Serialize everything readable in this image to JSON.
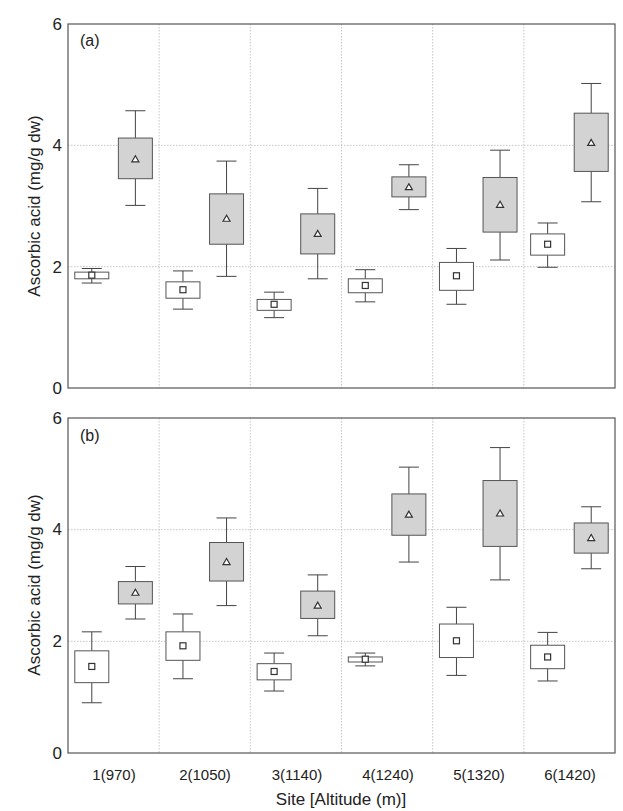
{
  "figure": {
    "ylabel": "Ascorbic acid (mg/g dw)",
    "xlabel": "Site [Altitude (m)]",
    "yticks": [
      "0",
      "2",
      "4",
      "6"
    ],
    "colors": {
      "white_box_fill": "#ffffff",
      "gray_box_fill": "#d3d3d3",
      "box_stroke": "#555555",
      "grid": "#b8b8b8"
    }
  },
  "chart_data": [
    {
      "type": "boxplot",
      "panel_label": "(a)",
      "title": "",
      "xlabel": "",
      "ylabel": "Ascorbic acid (mg/g dw)",
      "ylim": [
        0,
        6
      ],
      "yticks": [
        0,
        2,
        4,
        6
      ],
      "grid": true,
      "categories": [
        "1(970)",
        "2(1050)",
        "3(1140)",
        "4(1240)",
        "5(1320)",
        "6(1420)"
      ],
      "series": [
        {
          "name": "white boxes (square mean marker)",
          "marker": "square",
          "fill": "#ffffff",
          "whisker_low": [
            1.73,
            1.3,
            1.16,
            1.42,
            1.38,
            1.99
          ],
          "box_low": [
            1.8,
            1.48,
            1.28,
            1.57,
            1.61,
            2.19
          ],
          "mean": [
            1.86,
            1.62,
            1.38,
            1.69,
            1.85,
            2.37
          ],
          "box_high": [
            1.91,
            1.75,
            1.46,
            1.8,
            2.07,
            2.54
          ],
          "whisker_high": [
            1.97,
            1.93,
            1.58,
            1.95,
            2.3,
            2.72
          ]
        },
        {
          "name": "gray boxes (triangle mean marker)",
          "marker": "triangle",
          "fill": "#d3d3d3",
          "whisker_low": [
            3.01,
            1.84,
            1.8,
            2.94,
            2.11,
            3.07
          ],
          "box_low": [
            3.45,
            2.37,
            2.21,
            3.15,
            2.57,
            3.57
          ],
          "mean": [
            3.77,
            2.79,
            2.54,
            3.31,
            3.02,
            4.04
          ],
          "box_high": [
            4.12,
            3.2,
            2.87,
            3.48,
            3.47,
            4.53
          ],
          "whisker_high": [
            4.57,
            3.74,
            3.29,
            3.68,
            3.92,
            5.02
          ]
        }
      ]
    },
    {
      "type": "boxplot",
      "panel_label": "(b)",
      "title": "",
      "xlabel": "Site [Altitude (m)]",
      "ylabel": "Ascorbic acid (mg/g dw)",
      "ylim": [
        0,
        6
      ],
      "yticks": [
        0,
        2,
        4,
        6
      ],
      "grid": true,
      "categories": [
        "1(970)",
        "2(1050)",
        "3(1140)",
        "4(1240)",
        "5(1320)",
        "6(1420)"
      ],
      "series": [
        {
          "name": "white boxes (square mean marker)",
          "marker": "square",
          "fill": "#ffffff",
          "whisker_low": [
            0.9,
            1.33,
            1.11,
            1.56,
            1.39,
            1.29
          ],
          "box_low": [
            1.26,
            1.66,
            1.31,
            1.63,
            1.71,
            1.51
          ],
          "mean": [
            1.55,
            1.92,
            1.46,
            1.68,
            2.01,
            1.72
          ],
          "box_high": [
            1.83,
            2.17,
            1.6,
            1.72,
            2.31,
            1.93
          ],
          "whisker_high": [
            2.17,
            2.49,
            1.79,
            1.79,
            2.61,
            2.16
          ]
        },
        {
          "name": "gray boxes (triangle mean marker)",
          "marker": "triangle",
          "fill": "#d3d3d3",
          "whisker_low": [
            2.4,
            2.64,
            2.1,
            3.42,
            3.1,
            3.3
          ],
          "box_low": [
            2.67,
            3.08,
            2.41,
            3.9,
            3.7,
            3.58
          ],
          "mean": [
            2.87,
            3.42,
            2.64,
            4.27,
            4.29,
            3.85
          ],
          "box_high": [
            3.07,
            3.77,
            2.9,
            4.64,
            4.88,
            4.12
          ],
          "whisker_high": [
            3.34,
            4.21,
            3.19,
            5.12,
            5.47,
            4.41
          ]
        }
      ]
    }
  ]
}
